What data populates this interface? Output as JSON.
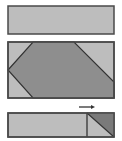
{
  "diagram": {
    "panels": [
      {
        "name": "top-panel",
        "x": 8,
        "y": 6,
        "w": 106,
        "h": 28,
        "fill": "#bdbdbd",
        "stroke": "#4a4a4a"
      },
      {
        "name": "middle-panel",
        "x": 8,
        "y": 42,
        "w": 106,
        "h": 56,
        "fill": "#bdbdbd",
        "stroke": "#4a4a4a",
        "shape_points": "8,70 33,42 74,42 114,82 114,98 33,98",
        "shape_fill": "#8e8e8e"
      },
      {
        "name": "bottom-panel",
        "x": 8,
        "y": 113,
        "w": 106,
        "h": 24,
        "fill": "#bdbdbd",
        "stroke": "#4a4a4a",
        "divider_x": 87,
        "triangle_points": "87,113 114,113 114,137",
        "triangle_fill": "#7a7a7a"
      }
    ],
    "arrow": {
      "x1": 79,
      "x2": 95,
      "y": 107,
      "direction": "right",
      "color": "#333333"
    }
  }
}
